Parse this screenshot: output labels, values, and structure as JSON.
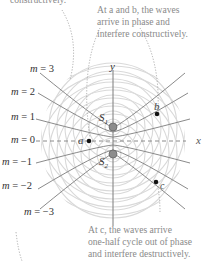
{
  "figure": {
    "captions": {
      "top_left": "constructively.",
      "top_right_line1": "At a and b, the waves",
      "top_right_line2": "arrive in phase and",
      "top_right_line3": "interfere constructively.",
      "bottom_right_line1": "At c, the waves arrive",
      "bottom_right_line2": "one-half cycle out of phase",
      "bottom_right_line3": "and interfere destructively."
    },
    "axes": {
      "x_label": "x",
      "y_label": "y"
    },
    "sources": [
      {
        "name": "S1",
        "label": "S",
        "sub": "1"
      },
      {
        "name": "S2",
        "label": "S",
        "sub": "2"
      }
    ],
    "points": {
      "a": "a",
      "b": "b",
      "c": "c"
    },
    "antinodal_lines": [
      {
        "var": "m",
        "eq": "= 3"
      },
      {
        "var": "m",
        "eq": "= 2"
      },
      {
        "var": "m",
        "eq": "= 1"
      },
      {
        "var": "m",
        "eq": "= 0"
      },
      {
        "var": "m",
        "eq": "= −1"
      },
      {
        "var": "m",
        "eq": "= −2"
      },
      {
        "var": "m",
        "eq": "= −3"
      }
    ],
    "colors": {
      "wavefront": "#d6d6d6",
      "line": "#7a7a7a",
      "caption": "#8a8a8a",
      "source": "#8c8c8c"
    }
  }
}
